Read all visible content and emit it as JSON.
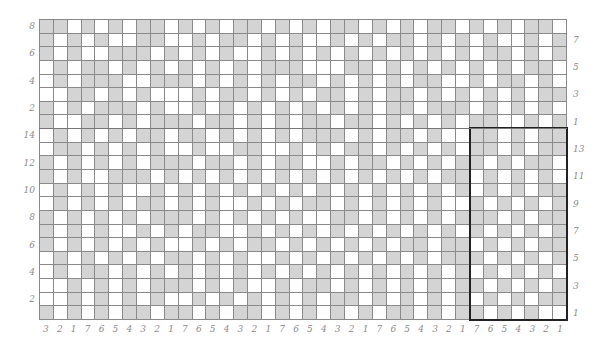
{
  "chart_data": {
    "type": "table",
    "title": "",
    "columns": 38,
    "sections": [
      {
        "name": "top",
        "rows": 8,
        "left_labels": [
          "8",
          "6",
          "4",
          "2"
        ],
        "right_labels": [
          "7",
          "5",
          "3",
          "1"
        ]
      },
      {
        "name": "bottom",
        "rows": 14,
        "left_labels": [
          "14",
          "12",
          "10",
          "8",
          "6",
          "4",
          "2"
        ],
        "right_labels": [
          "13",
          "11",
          "9",
          "7",
          "5",
          "3",
          "1"
        ]
      }
    ],
    "bottom_labels": [
      "3",
      "2",
      "1",
      "7",
      "6",
      "5",
      "4",
      "3",
      "2",
      "1",
      "7",
      "6",
      "5",
      "4",
      "3",
      "2",
      "1",
      "7",
      "6",
      "5",
      "4",
      "3",
      "2",
      "1",
      "7",
      "6",
      "5",
      "4",
      "3",
      "2",
      "1",
      "7",
      "6",
      "5",
      "4",
      "3",
      "2",
      "1"
    ],
    "repeat_box": {
      "col_start": 31,
      "col_end": 37,
      "row_start": 8,
      "row_end": 21
    },
    "rows": [
      "11010101101010110101011010101101010110",
      "10101001100101101010010101101010100101",
      "10100111010101001010101010101010110101",
      "01011010101010101110001101010101010110",
      "01011100111010101011010101011001011010",
      "00110101000101101010110101101010101011",
      "10101110100101010101010101101110101010",
      "10011010111011010101101101010101100101",
      "01010101101101010101110101101001101011",
      "01101010100100110010101101010101101011",
      "10101010111011010110010110101011010110",
      "10100111010101010101010101010110101010",
      "01010100101010101010101010101010101011",
      "01010101101010010101101010101001010101",
      "10101010111010101010011010101011101011",
      "10101001010110010101010101010101010101",
      "10101010100101011010101010110110101011",
      "01010101011010100101010101010111010101",
      "01011010101010101010101010101010101010",
      "00101010111010100101101010101011010101",
      "00101010100101010101011010101010101011",
      "10101011011010110101010101101011010100"
    ],
    "colors": {
      "contrast": "#d4d4d4",
      "main": "#ffffff",
      "grid": "#8a8a8a",
      "box": "#222222",
      "labels": "#8c8c8c"
    }
  }
}
